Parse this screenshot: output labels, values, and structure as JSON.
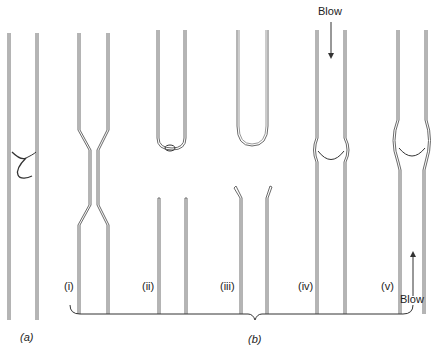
{
  "figure": {
    "panel_a": {
      "label": "(a)"
    },
    "panel_b": {
      "label": "(b)",
      "steps": [
        {
          "id": "i",
          "label": "(i)"
        },
        {
          "id": "ii",
          "label": "(ii)"
        },
        {
          "id": "iii",
          "label": "(iii)"
        },
        {
          "id": "iv",
          "label": "(iv)",
          "arrow_label": "Blow"
        },
        {
          "id": "v",
          "label": "(v)",
          "arrow_label": "Blow"
        }
      ]
    }
  },
  "colors": {
    "line": "#555555",
    "background": "#ffffff"
  }
}
